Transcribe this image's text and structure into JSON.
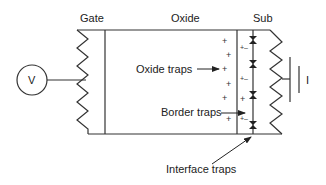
{
  "diagram": {
    "regions": {
      "gate": "Gate",
      "oxide": "Oxide",
      "substrate": "Sub"
    },
    "source": {
      "symbol": "V"
    },
    "ground": {
      "label": "I"
    },
    "annotations": {
      "oxide_traps": "Oxide traps",
      "border_traps": "Border traps",
      "interface_traps": "Interface traps"
    },
    "charges": {
      "oxide_plus": "+",
      "border_pair": "+–"
    },
    "colors": {
      "line": "#333333",
      "background": "#ffffff"
    }
  }
}
